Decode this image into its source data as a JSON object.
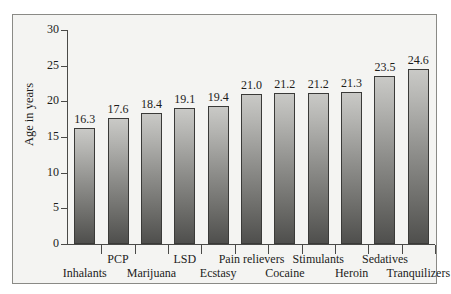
{
  "chart_data": {
    "type": "bar",
    "title": "",
    "subtitle": "",
    "xlabel": "",
    "ylabel": "Age in years",
    "ylim": [
      0,
      30
    ],
    "yticks": [
      0,
      5,
      10,
      15,
      20,
      25,
      30
    ],
    "ytick_labels": [
      "0",
      "5",
      "10",
      "15",
      "20",
      "25",
      "30"
    ],
    "grid": false,
    "legend": null,
    "bar_value_label_format": "one-decimal",
    "xtick_label_layout": "staggered-two-rows",
    "categories": [
      "Inhalants",
      "PCP",
      "Marijuana",
      "LSD",
      "Ecstasy",
      "Pain relievers",
      "Cocaine",
      "Stimulants",
      "Heroin",
      "Sedatives",
      "Tranquilizers"
    ],
    "values": [
      16.3,
      17.6,
      18.4,
      19.1,
      19.4,
      21.0,
      21.2,
      21.2,
      21.3,
      23.5,
      24.6
    ],
    "value_labels": [
      "16.3",
      "17.6",
      "18.4",
      "19.1",
      "19.4",
      "21.0",
      "21.2",
      "21.2",
      "21.3",
      "23.5",
      "24.6"
    ],
    "colors": {
      "bar_top": "#c9c9c6",
      "bar_bottom": "#4f4f4d",
      "bar_border": "#3a3a38",
      "axis": "#4a4a48",
      "text": "#1c1c1a",
      "plot_background": "#f4f4f2",
      "frame_border": "#8a8a86",
      "page_background": "#ffffff"
    }
  }
}
